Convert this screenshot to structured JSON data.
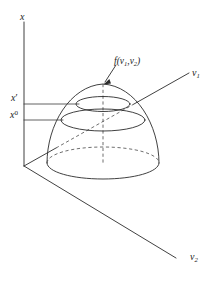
{
  "figure": {
    "name": "three-dimensional-objective-function-surface",
    "background_color": "#ffffff",
    "stroke_color": "#2b2b2b",
    "width": 217,
    "height": 283
  },
  "axes": {
    "vertical": {
      "name": "x",
      "label": "x",
      "description": "vertical objective value axis"
    },
    "depth_right": {
      "name": "v1",
      "label_base": "v",
      "label_sub": "1"
    },
    "depth_down": {
      "name": "v2",
      "label_base": "v",
      "label_sub": "2"
    }
  },
  "tick_labels": [
    {
      "name": "x-prime",
      "base": "x",
      "mark": "′",
      "kind": "prime"
    },
    {
      "name": "x-zero",
      "base": "x",
      "mark": "0",
      "kind": "superscript"
    }
  ],
  "annotation": {
    "name": "surface-function-callout",
    "prefix": "f(",
    "arg1_base": "v",
    "arg1_sub": "1",
    "separator": ",",
    "arg2_base": "v",
    "arg2_sub": "2",
    "suffix": ")",
    "points_to": "surface-apex"
  },
  "surface": {
    "name": "paraboloid-dome",
    "apex": {
      "x": 103,
      "y": 84
    },
    "base_center": {
      "x": 103,
      "y": 163
    },
    "base_rx": 56,
    "base_ry": 16,
    "contours": [
      {
        "name": "contour-x-prime",
        "center_y": 104,
        "rx": 27,
        "ry": 7.5
      },
      {
        "name": "contour-x-zero",
        "center_y": 120,
        "rx": 42,
        "ry": 11
      }
    ]
  },
  "level_lines": [
    {
      "name": "level-line-x-prime",
      "y": 104,
      "x_start": 24,
      "x_end": 78
    },
    {
      "name": "level-line-x-zero",
      "y": 120,
      "x_start": 24,
      "x_end": 63
    }
  ],
  "origin": {
    "x": 24,
    "y": 166
  }
}
